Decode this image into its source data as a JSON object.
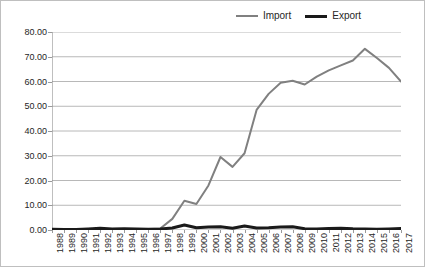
{
  "chart_data": {
    "type": "line",
    "title": "",
    "subtitle": "",
    "xlabel": "",
    "ylabel": "",
    "grid": "horizontal",
    "legend_position": "top-right",
    "ylim": [
      0,
      80
    ],
    "ytick_labels": [
      "0.00",
      "10.00",
      "20.00",
      "30.00",
      "40.00",
      "50.00",
      "60.00",
      "70.00",
      "80.00"
    ],
    "ytick_values": [
      0,
      10,
      20,
      30,
      40,
      50,
      60,
      70,
      80
    ],
    "categories": [
      "1988",
      "1989",
      "1990",
      "1991",
      "1992",
      "1993",
      "1994",
      "1995",
      "1996",
      "1997",
      "1998",
      "1999",
      "2000",
      "2001",
      "2002",
      "2003",
      "2004",
      "2005",
      "2006",
      "2007",
      "2008",
      "2009",
      "2010",
      "2011",
      "2012",
      "2013",
      "2014",
      "2015",
      "2016",
      "2017"
    ],
    "series": [
      {
        "name": "Import",
        "color": "#808080",
        "width": 2,
        "values": [
          0.4,
          0.3,
          0.25,
          0.3,
          0.45,
          0.35,
          0.35,
          0.4,
          0.4,
          0.6,
          4.5,
          11.8,
          10.5,
          18.0,
          29.5,
          25.5,
          31.0,
          48.5,
          55.0,
          59.5,
          60.3,
          58.8,
          62.0,
          64.5,
          66.5,
          68.5,
          73.2,
          69.5,
          65.5,
          60.0
        ]
      },
      {
        "name": "Export",
        "color": "#1a1a1a",
        "width": 3,
        "values": [
          0.35,
          0.25,
          0.2,
          0.45,
          0.7,
          0.45,
          0.5,
          0.4,
          0.3,
          0.4,
          0.8,
          2.0,
          0.9,
          1.2,
          1.3,
          0.7,
          1.6,
          0.8,
          0.9,
          1.2,
          1.3,
          0.5,
          0.4,
          0.6,
          0.7,
          0.5,
          0.45,
          0.3,
          0.4,
          0.6
        ]
      }
    ],
    "legend": [
      {
        "label": "Import",
        "swatch": "import-line-swatch",
        "color": "#808080"
      },
      {
        "label": "Export",
        "swatch": "export-line-swatch",
        "color": "#1a1a1a"
      }
    ]
  },
  "colors": {
    "import": "#808080",
    "export": "#1a1a1a",
    "gridline": "#a6a6a6",
    "axis": "#808080",
    "border": "#bfbfbf",
    "text": "#262626",
    "background": "#ffffff"
  }
}
